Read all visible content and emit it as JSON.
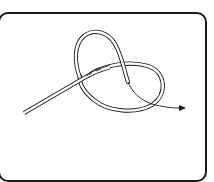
{
  "diagram": {
    "elements": [
      {
        "name": "rope-standing-part",
        "description": "double-line rope entering from lower left"
      },
      {
        "name": "rope-upper-loop",
        "description": "tall loop rising above the crossing"
      },
      {
        "name": "rope-lower-loop",
        "description": "oval loop to the right of the crossing"
      },
      {
        "name": "direction-arrow",
        "description": "thin arrow showing the working end pulled to the right"
      }
    ],
    "colors": {
      "stroke": "#1a1a1a",
      "rope_fill": "#ffffff",
      "background": "#ffffff"
    }
  }
}
